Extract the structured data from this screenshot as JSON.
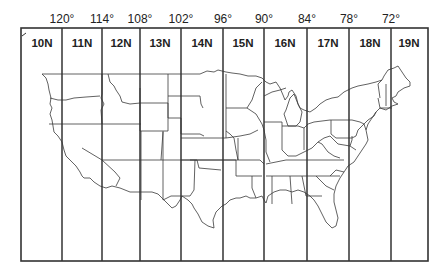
{
  "map": {
    "title": "UTM zones of the contiguous United States",
    "frame": {
      "left": 21,
      "top": 28,
      "right": 428,
      "bottom": 261
    },
    "line_color": "#333333",
    "state_line_color": "#3a3a3a",
    "zone_boundaries_x": [
      62,
      102,
      140,
      181,
      223,
      264,
      307,
      349,
      391
    ],
    "longitude_labels": [
      {
        "label": "120°",
        "x": 62
      },
      {
        "label": "114°",
        "x": 102
      },
      {
        "label": "108°",
        "x": 140
      },
      {
        "label": "102°",
        "x": 181
      },
      {
        "label": "96°",
        "x": 223
      },
      {
        "label": "90°",
        "x": 264
      },
      {
        "label": "84°",
        "x": 307
      },
      {
        "label": "78°",
        "x": 349
      },
      {
        "label": "72°",
        "x": 391
      }
    ],
    "zones": [
      {
        "label": "10N",
        "x": 42
      },
      {
        "label": "11N",
        "x": 82
      },
      {
        "label": "12N",
        "x": 121
      },
      {
        "label": "13N",
        "x": 160
      },
      {
        "label": "14N",
        "x": 202
      },
      {
        "label": "15N",
        "x": 243
      },
      {
        "label": "16N",
        "x": 285
      },
      {
        "label": "17N",
        "x": 328
      },
      {
        "label": "18N",
        "x": 370
      },
      {
        "label": "19N",
        "x": 409
      }
    ]
  }
}
